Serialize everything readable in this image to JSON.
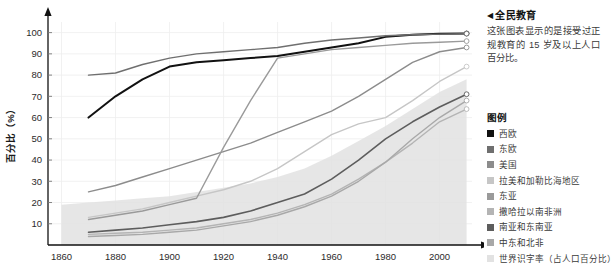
{
  "sidebar": {
    "marker": "◀",
    "title": "全民教育",
    "body": "这张图表显示的是接受过正规教育的 15 岁及以上人口百分比。",
    "legend_title": "图例"
  },
  "chart_data": {
    "type": "line",
    "title": "全民教育",
    "xlabel": "",
    "ylabel": "百分比（%）",
    "xlim": [
      1855,
      2012
    ],
    "ylim": [
      0,
      105
    ],
    "xticks": [
      "1860",
      "1880",
      "1900",
      "1920",
      "1940",
      "1960",
      "1980",
      "2000"
    ],
    "xtick_values": [
      1860,
      1880,
      1900,
      1920,
      1940,
      1960,
      1980,
      2000
    ],
    "yticks": [
      "10",
      "20",
      "30",
      "40",
      "50",
      "60",
      "70",
      "80",
      "90",
      "100"
    ],
    "ytick_values": [
      10,
      20,
      30,
      40,
      50,
      60,
      70,
      80,
      90,
      100
    ],
    "grid": true,
    "legend_position": "right",
    "endpoint_markers": true,
    "series": [
      {
        "name": "西欧",
        "color": "#111111",
        "width": 2.0,
        "x": [
          1870,
          1880,
          1890,
          1900,
          1910,
          1920,
          1930,
          1940,
          1950,
          1960,
          1970,
          1980,
          1990,
          2000,
          2010
        ],
        "values": [
          60,
          70,
          78,
          84,
          86,
          87,
          88,
          89,
          91,
          93,
          95,
          98,
          99,
          99.5,
          99.6
        ]
      },
      {
        "name": "东欧",
        "color": "#6f6f6f",
        "width": 1.4,
        "x": [
          1870,
          1880,
          1890,
          1900,
          1910,
          1920,
          1930,
          1940,
          1950,
          1960,
          1970,
          1980,
          1990,
          2000,
          2010
        ],
        "values": [
          80,
          81,
          85,
          88,
          90,
          91,
          92,
          93,
          95,
          96.5,
          97.5,
          98.5,
          99,
          99.3,
          99.5
        ]
      },
      {
        "name": "美国",
        "color": "#8c8c8c",
        "width": 1.4,
        "x": [
          1870,
          1880,
          1890,
          1900,
          1910,
          1920,
          1930,
          1940,
          1950,
          1960,
          1970,
          1980,
          1990,
          2000,
          2010
        ],
        "values": [
          25,
          28,
          32,
          36,
          40,
          44,
          48,
          53,
          58,
          63,
          70,
          78,
          86,
          91,
          93
        ]
      },
      {
        "name": "拉美和加勒比海地区",
        "color": "#c6c6c6",
        "width": 1.4,
        "x": [
          1870,
          1880,
          1890,
          1900,
          1910,
          1920,
          1930,
          1940,
          1950,
          1960,
          1970,
          1980,
          1990,
          2000,
          2010
        ],
        "values": [
          13,
          15,
          17,
          20,
          23,
          26,
          30,
          36,
          44,
          52,
          57,
          60,
          68,
          77,
          84
        ]
      },
      {
        "name": "东亚",
        "color": "#9a9a9a",
        "width": 1.4,
        "x": [
          1870,
          1880,
          1890,
          1900,
          1910,
          1920,
          1930,
          1940,
          1950,
          1960,
          1970,
          1980,
          1990,
          2000,
          2010
        ],
        "values": [
          12,
          14,
          16,
          19,
          22,
          46,
          68,
          88,
          90,
          92,
          93,
          94,
          95,
          95.5,
          96
        ]
      },
      {
        "name": "撒哈拉以南非洲",
        "color": "#b4b4b4",
        "width": 1.4,
        "x": [
          1870,
          1880,
          1890,
          1900,
          1910,
          1920,
          1930,
          1940,
          1950,
          1960,
          1970,
          1980,
          1990,
          2000,
          2010
        ],
        "values": [
          5,
          5.5,
          6,
          7,
          8,
          10,
          12,
          15,
          19,
          24,
          31,
          39,
          48,
          58,
          64
        ]
      },
      {
        "name": "南亚和东南亚",
        "color": "#5d5d5d",
        "width": 1.6,
        "x": [
          1870,
          1880,
          1890,
          1900,
          1910,
          1920,
          1930,
          1940,
          1950,
          1960,
          1970,
          1980,
          1990,
          2000,
          2010
        ],
        "values": [
          6,
          7,
          8,
          9.5,
          11,
          13,
          16,
          20,
          24,
          31,
          40,
          50,
          58,
          65,
          71
        ]
      },
      {
        "name": "中东和北非",
        "color": "#a8a8a8",
        "width": 1.4,
        "x": [
          1870,
          1880,
          1890,
          1900,
          1910,
          1920,
          1930,
          1940,
          1950,
          1960,
          1970,
          1980,
          1990,
          2000,
          2010
        ],
        "values": [
          4,
          4.5,
          5,
          6,
          7,
          9,
          11,
          14,
          18,
          23,
          30,
          39,
          50,
          60,
          68
        ]
      },
      {
        "name": "世界识字率（占人口百分比）",
        "color": "#e2e2e2",
        "width": 0,
        "area": true,
        "x": [
          1860,
          1870,
          1880,
          1890,
          1900,
          1910,
          1920,
          1930,
          1940,
          1950,
          1960,
          1970,
          1980,
          1990,
          2000,
          2010
        ],
        "values": [
          19,
          20,
          21,
          22,
          23,
          25,
          27,
          29,
          32,
          36,
          42,
          49,
          56,
          64,
          72,
          78
        ]
      }
    ]
  }
}
